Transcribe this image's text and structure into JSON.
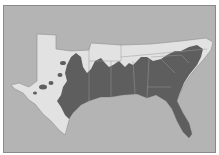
{
  "map": {
    "title": "",
    "region": "Southeastern United States",
    "colors": {
      "water": "#b4b4b4",
      "land": "#e2e2e2",
      "range": "#5e5e5e",
      "border": "#8a8a8a",
      "state_lines": "#9a9a9a"
    },
    "layers": [
      {
        "name": "land",
        "description": "Southern states outline (TX to VA/NC)"
      },
      {
        "name": "distribution-range",
        "description": "Dark shaded range covering Gulf & southeastern coastal states"
      }
    ]
  }
}
